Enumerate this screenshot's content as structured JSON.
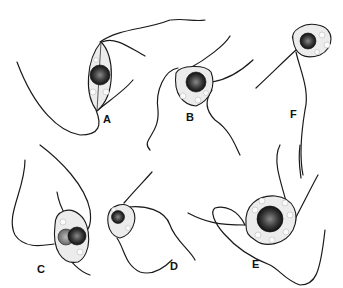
{
  "figure": {
    "panels": [
      {
        "label": "A",
        "x": 106,
        "y": 121
      },
      {
        "label": "B",
        "x": 186,
        "y": 119
      },
      {
        "label": "F",
        "x": 290,
        "y": 116
      },
      {
        "label": "C",
        "x": 40,
        "y": 272
      },
      {
        "label": "D",
        "x": 172,
        "y": 270
      },
      {
        "label": "E",
        "x": 254,
        "y": 268
      }
    ]
  }
}
